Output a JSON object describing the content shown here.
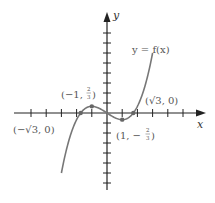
{
  "chart_data": {
    "type": "line",
    "title": "",
    "xlabel": "x",
    "ylabel": "y",
    "curve_label": "y = f(x)",
    "function": "f(x) = x^3/3 - x",
    "x_range": [
      -3.0,
      3.0
    ],
    "xlim": [
      -6.2,
      6.4
    ],
    "ylim": [
      -7.7,
      10.1
    ],
    "x_ticks": [
      -5,
      -4,
      -3,
      -2,
      -1,
      1,
      2,
      3,
      4,
      5
    ],
    "y_ticks": [
      -7,
      -6,
      -5,
      -4,
      -3,
      -2,
      -1,
      1,
      2,
      3,
      4,
      5,
      6,
      7,
      8
    ],
    "grid": false,
    "legend": null,
    "marked_points": [
      {
        "label": "(−√3, 0)",
        "x": -1.732,
        "y": 0
      },
      {
        "label": "(−1, 2/3)",
        "x": -1,
        "y": 0.667
      },
      {
        "label": "(1, −2/3)",
        "x": 1,
        "y": -0.667
      },
      {
        "label": "(√3, 0)",
        "x": 1.732,
        "y": 0
      }
    ],
    "series": [
      {
        "name": "y = f(x)",
        "x": [
          -3.0,
          -2.5,
          -2.0,
          -1.732,
          -1.5,
          -1.0,
          -0.5,
          0,
          0.5,
          1.0,
          1.5,
          1.732,
          2.0,
          2.5,
          3.0
        ],
        "values": [
          -6.0,
          -2.708,
          -0.667,
          0,
          0.375,
          0.667,
          0.458,
          0,
          -0.458,
          -0.667,
          -0.375,
          0,
          0.667,
          2.708,
          6.0
        ]
      }
    ]
  },
  "labels": {
    "x_axis": "x",
    "y_axis": "y",
    "curve": "y = f(x)",
    "p_neg_root": "(−√3, 0)",
    "p_max_pre": "(−1, ",
    "p_max_frac_num": "2",
    "p_max_frac_den": "3",
    "p_max_post": ")",
    "p_min_pre": "(1, −",
    "p_min_frac_num": "2",
    "p_min_frac_den": "3",
    "p_min_post": ")",
    "p_pos_root": "(√3, 0)"
  },
  "colors": {
    "axis": "#222222",
    "curve": "#777777",
    "point": "#666666",
    "label": "#555555"
  }
}
